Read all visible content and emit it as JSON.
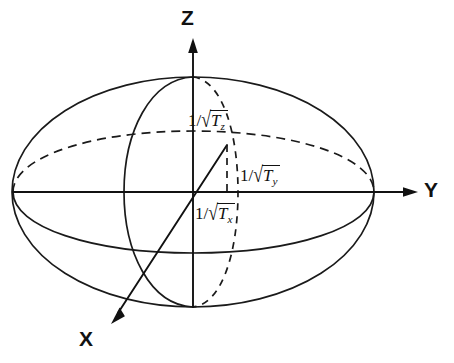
{
  "figure": {
    "type": "ellipsoid-3d-axes-diagram",
    "background_color": "#ffffff",
    "ink_color": "#111111"
  },
  "axes": [
    {
      "id": "z",
      "label": "Z",
      "direction": "up",
      "arrow": true
    },
    {
      "id": "y",
      "label": "Y",
      "direction": "right",
      "arrow": true
    },
    {
      "id": "x",
      "label": "X",
      "direction": "down-left",
      "arrow": true
    }
  ],
  "semi_axis_labels": [
    {
      "id": "tz",
      "numerator": "1",
      "slash": "/",
      "radicand": "T",
      "subscript": "z",
      "text": "1/√T_z"
    },
    {
      "id": "ty",
      "numerator": "1",
      "slash": "/",
      "radicand": "T",
      "subscript": "y",
      "text": "1/√T_y"
    },
    {
      "id": "tx",
      "numerator": "1",
      "slash": "/",
      "radicand": "T",
      "subscript": "x",
      "text": "1/√T_x"
    }
  ],
  "curves": {
    "outline": {
      "style": "solid",
      "name": "ellipsoid-outline"
    },
    "equator_front": {
      "style": "solid",
      "name": "equator-front-arc"
    },
    "equator_back": {
      "style": "dashed",
      "name": "equator-back-arc"
    },
    "meridian_front": {
      "style": "solid",
      "name": "meridian-front-arc"
    },
    "meridian_back": {
      "style": "dashed",
      "name": "meridian-back-arc"
    }
  }
}
